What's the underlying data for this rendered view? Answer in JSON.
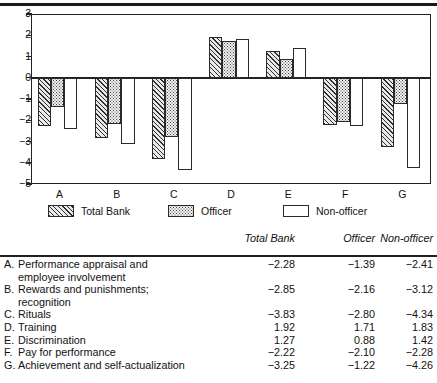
{
  "figure": {
    "top_rule": true
  },
  "chart_data": {
    "type": "bar",
    "title": "",
    "xlabel": "",
    "ylabel": "",
    "ylim": [
      -5,
      3
    ],
    "yticks": [
      "3",
      "2",
      "1",
      "0",
      "−1",
      "−2",
      "−3",
      "−4",
      "−5"
    ],
    "categories": [
      "A",
      "B",
      "C",
      "D",
      "E",
      "F",
      "G"
    ],
    "grid": false,
    "legend_position": "below-axes",
    "series": [
      {
        "name": "Total Bank",
        "pattern": "diagonal-hatch",
        "values": [
          -2.28,
          -2.85,
          -3.83,
          1.92,
          1.27,
          -2.22,
          -3.25
        ]
      },
      {
        "name": "Officer",
        "pattern": "stipple-dot",
        "values": [
          -1.39,
          -2.16,
          -2.8,
          1.71,
          0.88,
          -2.1,
          -1.22
        ]
      },
      {
        "name": "Non-officer",
        "pattern": "open-white",
        "values": [
          -2.41,
          -3.12,
          -4.34,
          1.83,
          1.42,
          -2.28,
          -4.26
        ]
      }
    ]
  },
  "legend": {
    "items": [
      {
        "label": "Total Bank",
        "pattern": "diagonal-hatch"
      },
      {
        "label": "Officer",
        "pattern": "stipple-dot"
      },
      {
        "label": "Non-officer",
        "pattern": "open-white"
      }
    ]
  },
  "table": {
    "columns": [
      "Total Bank",
      "Officer",
      "Non-officer"
    ],
    "rows": [
      {
        "letter": "A.",
        "label": "Performance appraisal and",
        "label2": "employee involvement",
        "total_bank": "−2.28",
        "officer": "−1.39",
        "non_officer": "−2.41"
      },
      {
        "letter": "B.",
        "label": "Rewards and punishments;",
        "label2": "recognition",
        "total_bank": "−2.85",
        "officer": "−2.16",
        "non_officer": "−3.12"
      },
      {
        "letter": "C.",
        "label": "Rituals",
        "label2": "",
        "total_bank": "−3.83",
        "officer": "−2.80",
        "non_officer": "−4.34"
      },
      {
        "letter": "D.",
        "label": "Training",
        "label2": "",
        "total_bank": "1.92",
        "officer": "1.71",
        "non_officer": "1.83"
      },
      {
        "letter": "E.",
        "label": "Discrimination",
        "label2": "",
        "total_bank": "1.27",
        "officer": "0.88",
        "non_officer": "1.42"
      },
      {
        "letter": "F.",
        "label": "Pay for performance",
        "label2": "",
        "total_bank": "−2.22",
        "officer": "−2.10",
        "non_officer": "−2.28"
      },
      {
        "letter": "G.",
        "label": "Achievement and self-actualization",
        "label2": "",
        "total_bank": "−3.25",
        "officer": "−1.22",
        "non_officer": "−4.26"
      }
    ]
  },
  "colors": {
    "ink": "#1a1a1a",
    "hatch": "#2f2f2f",
    "paper": "#ffffff"
  }
}
